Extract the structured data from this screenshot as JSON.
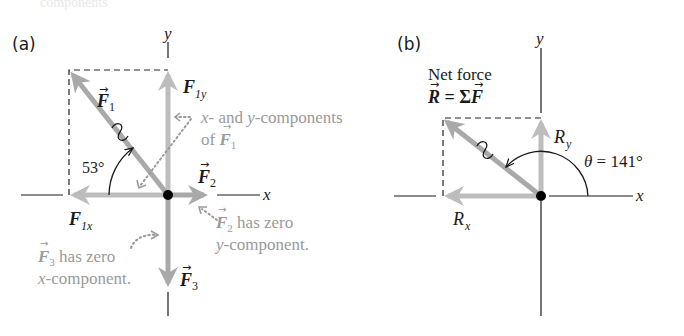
{
  "top_text": "components",
  "panel_a": {
    "label": "(a)",
    "axis_x": "x",
    "axis_y": "y",
    "origin": [
      168,
      195
    ],
    "vectors": {
      "F1": {
        "name": "F",
        "sub": "1",
        "tip": [
          69,
          70
        ],
        "angle_deg": 127
      },
      "F1x": {
        "name": "F",
        "sub": "1x",
        "tip": [
          69,
          195
        ]
      },
      "F1y": {
        "name": "F",
        "sub": "1y",
        "tip": [
          168,
          70
        ]
      },
      "F2": {
        "name": "F",
        "sub": "2",
        "tip": [
          207,
          195
        ]
      },
      "F3": {
        "name": "F",
        "sub": "3",
        "tip": [
          168,
          287
        ]
      }
    },
    "angle_label": "53°",
    "callouts": {
      "components_line1": "x- and y-components",
      "components_line1_a": "x",
      "components_line1_b": "- and ",
      "components_line1_c": "y",
      "components_line1_d": "-components",
      "components_line2_a": "of ",
      "components_line2_vec": "F",
      "components_line2_sub": "1",
      "f2_line1_vec": "F",
      "f2_line1_sub": "2",
      "f2_line1_rest": " has zero",
      "f2_line2_a": "y",
      "f2_line2_b": "-component.",
      "f3_line1_vec": "F",
      "f3_line1_sub": "3",
      "f3_line1_rest": " has zero",
      "f3_line2_a": "x",
      "f3_line2_b": "-component."
    }
  },
  "panel_b": {
    "label": "(b)",
    "axis_x": "x",
    "axis_y": "y",
    "origin": [
      541,
      196
    ],
    "title_line1": "Net force",
    "title_eq_R": "R",
    "title_eq_mid": " = Σ",
    "title_eq_F": "F",
    "vectors": {
      "R": {
        "name": "R",
        "tip": [
          443,
          118
        ]
      },
      "Rx": {
        "name": "R",
        "sub": "x",
        "tip": [
          443,
          196
        ]
      },
      "Ry": {
        "name": "R",
        "sub": "y",
        "tip": [
          541,
          118
        ]
      }
    },
    "angle_label_theta": "θ",
    "angle_label_rest": " = 141°",
    "angle_deg": 141
  },
  "colors": {
    "vector": "#a9a9a9",
    "vector_component": "#bdbdbd",
    "axis": "#1a1a1a",
    "callout_text": "#9a9a9a",
    "origin_dot": "#000000"
  }
}
